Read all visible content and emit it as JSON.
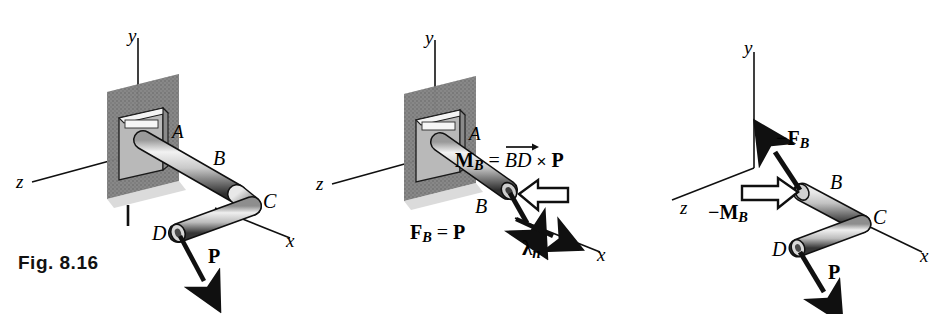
{
  "figure": {
    "caption": "Fig. 8.16",
    "background": "#ffffff",
    "ink": "#101010"
  },
  "panels": [
    {
      "id": "panel-original",
      "axes": {
        "y": "y",
        "z": "z",
        "x": "x"
      },
      "points": {
        "a": "A",
        "b": "B",
        "c": "C",
        "d": "D"
      },
      "forces": [
        {
          "name": "force-p",
          "label": "P"
        }
      ]
    },
    {
      "id": "panel-force-couple",
      "axes": {
        "y": "y",
        "z": "z",
        "x": "x"
      },
      "points": {
        "a": "A",
        "b": "B"
      },
      "moment": {
        "name": "moment-mb",
        "m": "M",
        "m_sub": "B",
        "equals": "=",
        "bd": "BD",
        "cross": "×",
        "p": "P"
      },
      "force": {
        "name": "force-fb",
        "f": "F",
        "f_sub": "B",
        "equals": "=",
        "p": "P"
      },
      "unit_vector": {
        "name": "lambda-n",
        "symbol": "λ",
        "sub": "n"
      }
    },
    {
      "id": "panel-equivalent",
      "axes": {
        "y": "y",
        "z": "z",
        "x": "x"
      },
      "points": {
        "b": "B",
        "c": "C",
        "d": "D"
      },
      "reaction_force": {
        "name": "force-neg-fb",
        "minus": "−",
        "f": "F",
        "sub": "B"
      },
      "reaction_moment": {
        "name": "moment-neg-mb",
        "minus": "−",
        "m": "M",
        "sub": "B"
      },
      "forces": [
        {
          "name": "force-p",
          "label": "P"
        }
      ]
    }
  ]
}
